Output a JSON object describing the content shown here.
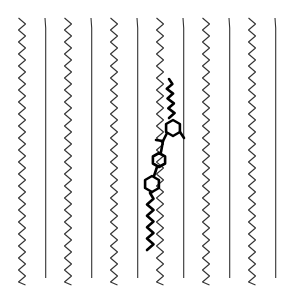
{
  "diagram": {
    "description": "Lipid bilayer-like array of hydrocarbon chains with an embedded rod-shaped amphiphilic molecule (aromatic core with alkyl tails)",
    "canvas": {
      "width": 292,
      "height": 299,
      "background": "#ffffff"
    },
    "chains": {
      "count": 12,
      "top_y": 18,
      "bottom_y": 285,
      "color": "#333333",
      "items": [
        {
          "x": 22,
          "style": "zigzag"
        },
        {
          "x": 45,
          "style": "straight"
        },
        {
          "x": 68,
          "style": "zigzag"
        },
        {
          "x": 91,
          "style": "straight"
        },
        {
          "x": 114,
          "style": "zigzag"
        },
        {
          "x": 137,
          "style": "straight"
        },
        {
          "x": 160,
          "style": "zigzag"
        },
        {
          "x": 183,
          "style": "straight"
        },
        {
          "x": 206,
          "style": "zigzag"
        },
        {
          "x": 229,
          "style": "straight"
        },
        {
          "x": 252,
          "style": "zigzag"
        },
        {
          "x": 275,
          "style": "straight"
        }
      ]
    },
    "guest_molecule": {
      "color": "#000000",
      "rings": [
        {
          "cx": 173,
          "cy": 128,
          "r": 8
        },
        {
          "cx": 159,
          "cy": 160,
          "r": 7
        },
        {
          "cx": 152,
          "cy": 184,
          "r": 8
        }
      ],
      "top_tail": {
        "from": [
          169,
          79
        ],
        "to": [
          172,
          118
        ]
      },
      "bottom_tail": {
        "from": [
          150,
          193
        ],
        "to": [
          150,
          250
        ]
      }
    }
  }
}
